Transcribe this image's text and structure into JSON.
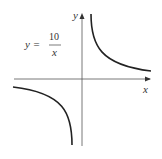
{
  "equation": {
    "lhs": "y =",
    "numerator": "10",
    "denominator": "x"
  },
  "axes": {
    "x_label": "x",
    "y_label": "y"
  },
  "colors": {
    "curve": "#222222",
    "axis": "#555555",
    "text": "#333333"
  }
}
